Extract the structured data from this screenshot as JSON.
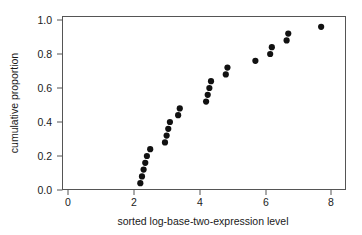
{
  "chart_data": {
    "type": "scatter",
    "title": "",
    "xlabel": "sorted log-base-two-expression level",
    "ylabel": "cumulative proportion",
    "xlim": [
      0,
      8
    ],
    "ylim": [
      0.0,
      1.0
    ],
    "xticks": [
      0,
      2,
      4,
      6,
      8
    ],
    "xtick_labels": [
      "0",
      "2",
      "4",
      "6",
      "8"
    ],
    "yticks": [
      0.0,
      0.2,
      0.4,
      0.6,
      0.8,
      1.0
    ],
    "ytick_labels": [
      "0.0",
      "0.2",
      "0.4",
      "0.6",
      "0.8",
      "1.0"
    ],
    "grid": false,
    "legend": "none",
    "marker": "filled-circle",
    "marker_color": "#111111",
    "x": [
      2.2,
      2.25,
      2.3,
      2.35,
      2.4,
      2.5,
      2.95,
      3.0,
      3.05,
      3.1,
      3.35,
      3.4,
      4.2,
      4.25,
      4.3,
      4.35,
      4.8,
      4.85,
      5.7,
      6.15,
      6.2,
      6.65,
      6.7,
      7.7
    ],
    "y": [
      0.04,
      0.08,
      0.12,
      0.16,
      0.2,
      0.24,
      0.28,
      0.32,
      0.36,
      0.4,
      0.44,
      0.48,
      0.52,
      0.56,
      0.6,
      0.64,
      0.68,
      0.72,
      0.76,
      0.8,
      0.84,
      0.88,
      0.92,
      0.96
    ],
    "n_points": 24
  },
  "axes": {
    "x_axis_label": "sorted log-base-two-expression level",
    "y_axis_label": "cumulative proportion"
  }
}
